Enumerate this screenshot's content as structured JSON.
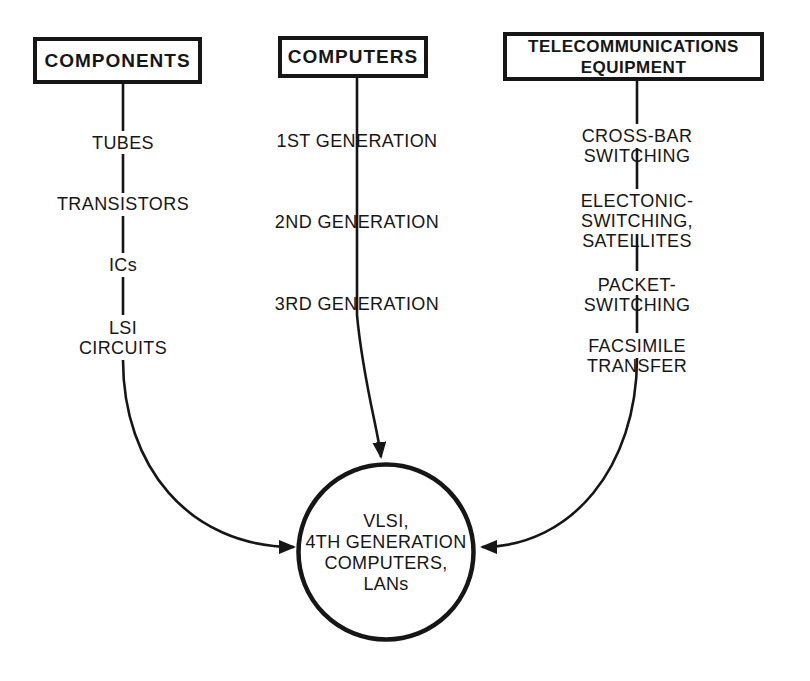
{
  "diagram": {
    "background_color": "#ffffff",
    "ink_color": "#161616"
  },
  "columns": [
    {
      "header": "COMPONENTS",
      "items": [
        "TUBES",
        "TRANSISTORS",
        "ICs",
        "LSI\nCIRCUITS"
      ]
    },
    {
      "header": "COMPUTERS",
      "items": [
        "1ST GENERATION",
        "2ND GENERATION",
        "3RD GENERATION"
      ]
    },
    {
      "header": "TELECOMMUNICATIONS\nEQUIPMENT",
      "items": [
        "CROSS-BAR SWITCHING",
        "ELECTONIC-SWITCHING,\nSATELLITES",
        "PACKET-SWITCHING",
        "FACSIMILE TRANSFER"
      ]
    }
  ],
  "center_node": {
    "label": "VLSI,\n4TH GENERATION\nCOMPUTERS,\nLANs"
  }
}
